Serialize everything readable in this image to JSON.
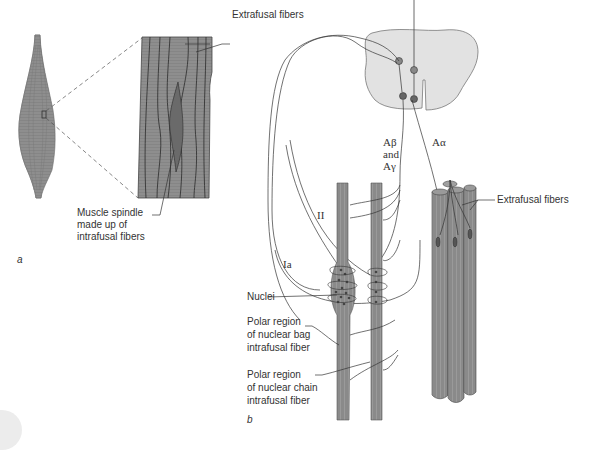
{
  "figure": {
    "panel_a": {
      "label": "a",
      "callouts": {
        "extrafusal": "Extrafusal fibers",
        "spindle": [
          "Muscle spindle",
          "made up of",
          "intrafusal fibers"
        ]
      }
    },
    "panel_b": {
      "label": "b",
      "nerve_labels": {
        "ab_line1": "Aβ",
        "ab_line2": "and",
        "ab_line3": "Aγ",
        "aa": "Aα",
        "ii": "II",
        "ia": "Ia"
      },
      "callouts": {
        "extrafusal": "Extrafusal fibers",
        "nuclei": "Nuclei",
        "polar_bag": [
          "Polar region",
          "of nuclear bag",
          "intrafusal fiber"
        ],
        "polar_chain": [
          "Polar region",
          "of nuclear chain",
          "intrafusal fiber"
        ]
      }
    },
    "colors": {
      "muscle_fill": "#8c8c8c",
      "spindle_fill": "#6e6e6e",
      "spinal_cord_fill": "#e2e2e2",
      "neuron_fill": "#777777",
      "line": "#333333",
      "text": "#333333"
    }
  }
}
